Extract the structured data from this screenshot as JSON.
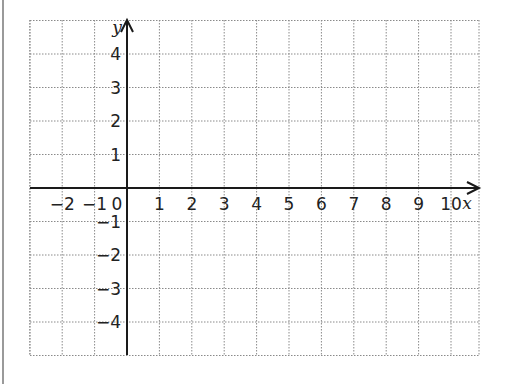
{
  "diagram": {
    "type": "coordinate-grid",
    "x_axis": {
      "label": "x",
      "ticks": [
        "−2",
        "−1",
        "0",
        "1",
        "2",
        "3",
        "4",
        "5",
        "6",
        "7",
        "8",
        "9",
        "10"
      ],
      "min": -3,
      "max": 11
    },
    "y_axis": {
      "label": "y",
      "ticks": [
        "4",
        "3",
        "2",
        "1",
        "−1",
        "−2",
        "−3",
        "−4"
      ],
      "min": -5,
      "max": 5
    },
    "grid": "dotted",
    "colors": {
      "grid": "#8a8a8a",
      "axis": "#1a1a1a",
      "border": "#9a9a9a"
    }
  }
}
